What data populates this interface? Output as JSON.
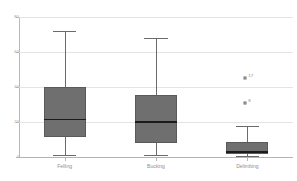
{
  "chart_data": {
    "type": "box",
    "title": "",
    "xlabel": "",
    "ylabel": "",
    "ylim": [
      0,
      80
    ],
    "grid": true,
    "legend": "none",
    "categories": [
      "Felling",
      "Bucking",
      "Delimbing"
    ],
    "yticks": [
      {
        "value": 80,
        "label": "80"
      },
      {
        "value": 60,
        "label": "60"
      },
      {
        "value": 40,
        "label": "40"
      },
      {
        "value": 20,
        "label": "20"
      },
      {
        "value": 0,
        "label": "0"
      }
    ],
    "boxes": [
      {
        "category": "Felling",
        "whisker_low": 1.0,
        "q1": 11.5,
        "median": 21.5,
        "q3": 40.0,
        "whisker_high": 72.0,
        "outliers": []
      },
      {
        "category": "Bucking",
        "whisker_low": 1.0,
        "q1": 8.0,
        "median": 20.0,
        "q3": 35.5,
        "whisker_high": 68.0,
        "outliers": []
      },
      {
        "category": "Delimbing",
        "whisker_low": 0.5,
        "q1": 1.5,
        "median": 3.0,
        "q3": 8.5,
        "whisker_high": 17.5,
        "outliers": [
          {
            "value": 45.0,
            "label": "17"
          },
          {
            "value": 31.0,
            "label": "8"
          }
        ]
      }
    ],
    "colors": {
      "box_fill": "#6f6f6f",
      "box_border": "#5a5a5a",
      "median": "#1b1b1b",
      "whisker": "#6b6b6b",
      "gridline": "#e4e4e4",
      "axis": "#b4b4b4",
      "tick_text": "#8e8e8e",
      "background": "#ffffff"
    }
  }
}
